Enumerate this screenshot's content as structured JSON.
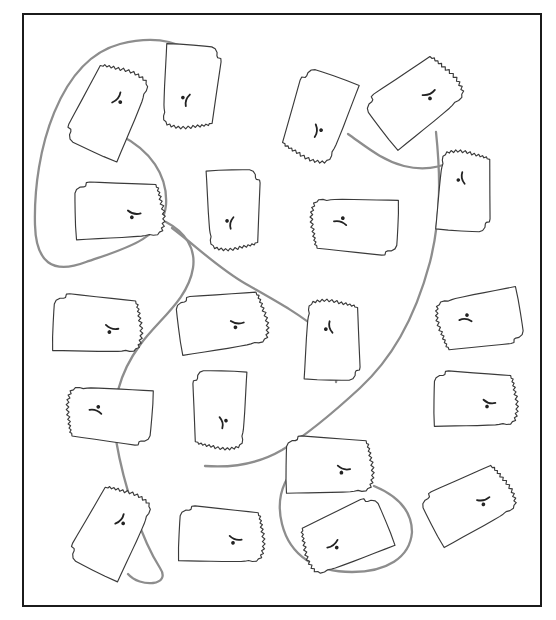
{
  "figure": {
    "shape_name": "pennsylvania",
    "shape_count": 19,
    "connector_count": 6,
    "colors": {
      "background": "#ffffff",
      "frame_border": "#1b1b1b",
      "shape_stroke": "#3a3a3a",
      "shape_fill": "#ffffff",
      "connector_stroke": "#8d8d8d"
    },
    "frame": {
      "x": 22,
      "y": 13,
      "width": 520,
      "height": 594,
      "border_width": 2
    }
  },
  "outline_geometry": {
    "comment": "Normalized Pennsylvania outline in a 100 x 61 local box. Western and northern edges straight; eastern edge is the jagged Delaware River; southwest notch and Erie triangle included.",
    "viewbox": "0 0 100 61",
    "path": "M 2.0 12.4 L 3.6 8.6 L 7.4 6.2 L 11.0 6.0 L 13.0 5.0 L 13.6 1.6 L 17.0 1.0 L 27.0 1.4 L 44.0 2.1 L 60.0 2.7 L 74.0 3.2 L 84.6 3.6 L 85.2 6.4 L 87.4 7.2 L 86.2 10.0 L 88.6 11.6 L 87.2 14.2 L 90.0 15.8 L 88.0 18.6 L 91.0 20.6 L 89.0 23.4 L 92.6 25.2 L 90.4 28.4 L 93.6 30.6 L 91.2 33.6 L 94.2 35.8 L 91.6 38.6 L 94.0 41.0 L 91.0 43.2 L 93.2 46.0 L 90.2 47.8 L 91.6 50.6 L 88.2 52.0 L 86.4 54.6 L 82.0 55.2 L 78.0 54.4 L 74.0 55.4 L 70.0 56.0 L 62.0 56.6 L 50.0 57.4 L 38.0 58.0 L 26.0 58.6 L 14.0 59.2 L 3.6 59.8 L 2.6 46.0 L 2.2 32.0 L 2.0 20.0 Z",
    "inner_marks": [
      {
        "name": "susquehanna-river-mark",
        "path": "M 56 30 q 6 5 13 3"
      },
      {
        "name": "city-dot-mark",
        "path": "M 60 36 a 1 1 0 1 0 0.1 0"
      }
    ]
  },
  "shapes": [
    {
      "id": "shape-01",
      "label": "pennsylvania-outline-1",
      "cx": 110,
      "cy": 108,
      "w": 98,
      "h": 62,
      "rotate": -64,
      "flip": false
    },
    {
      "id": "shape-02",
      "label": "pennsylvania-outline-2",
      "cx": 190,
      "cy": 89,
      "w": 92,
      "h": 58,
      "rotate": 96,
      "flip": false
    },
    {
      "id": "shape-03",
      "label": "pennsylvania-outline-3",
      "cx": 318,
      "cy": 119,
      "w": 96,
      "h": 60,
      "rotate": -72,
      "flip": true
    },
    {
      "id": "shape-04",
      "label": "pennsylvania-outline-4",
      "cx": 418,
      "cy": 99,
      "w": 100,
      "h": 62,
      "rotate": -36,
      "flip": false
    },
    {
      "id": "shape-05",
      "label": "pennsylvania-outline-5",
      "cx": 464,
      "cy": 189,
      "w": 88,
      "h": 56,
      "rotate": 92,
      "flip": true
    },
    {
      "id": "shape-06",
      "label": "pennsylvania-outline-6",
      "cx": 122,
      "cy": 211,
      "w": 98,
      "h": 60,
      "rotate": 0,
      "flip": false
    },
    {
      "id": "shape-07",
      "label": "pennsylvania-outline-7",
      "cx": 233,
      "cy": 212,
      "w": 88,
      "h": 56,
      "rotate": 90,
      "flip": false
    },
    {
      "id": "shape-08",
      "label": "pennsylvania-outline-8",
      "cx": 352,
      "cy": 225,
      "w": 96,
      "h": 58,
      "rotate": 184,
      "flip": false
    },
    {
      "id": "shape-09",
      "label": "pennsylvania-outline-9",
      "cx": 100,
      "cy": 325,
      "w": 98,
      "h": 60,
      "rotate": 4,
      "flip": false
    },
    {
      "id": "shape-10",
      "label": "pennsylvania-outline-10",
      "cx": 225,
      "cy": 322,
      "w": 98,
      "h": 60,
      "rotate": -6,
      "flip": false
    },
    {
      "id": "shape-11",
      "label": "pennsylvania-outline-11",
      "cx": 332,
      "cy": 338,
      "w": 88,
      "h": 58,
      "rotate": 90,
      "flip": true
    },
    {
      "id": "shape-12",
      "label": "pennsylvania-outline-12",
      "cx": 477,
      "cy": 320,
      "w": 92,
      "h": 58,
      "rotate": 172,
      "flip": false
    },
    {
      "id": "shape-13",
      "label": "pennsylvania-outline-13",
      "cx": 107,
      "cy": 414,
      "w": 94,
      "h": 58,
      "rotate": 186,
      "flip": false
    },
    {
      "id": "shape-14",
      "label": "pennsylvania-outline-14",
      "cx": 220,
      "cy": 412,
      "w": 86,
      "h": 56,
      "rotate": -90,
      "flip": true
    },
    {
      "id": "shape-15",
      "label": "pennsylvania-outline-15",
      "cx": 478,
      "cy": 400,
      "w": 92,
      "h": 58,
      "rotate": 2,
      "flip": false
    },
    {
      "id": "shape-16",
      "label": "pennsylvania-outline-16",
      "cx": 332,
      "cy": 466,
      "w": 96,
      "h": 60,
      "rotate": 2,
      "flip": false
    },
    {
      "id": "shape-17",
      "label": "pennsylvania-outline-17",
      "cx": 113,
      "cy": 529,
      "w": 96,
      "h": 60,
      "rotate": -62,
      "flip": false
    },
    {
      "id": "shape-18",
      "label": "pennsylvania-outline-18",
      "cx": 224,
      "cy": 536,
      "w": 94,
      "h": 58,
      "rotate": 4,
      "flip": false
    },
    {
      "id": "shape-19",
      "label": "pennsylvania-outline-19",
      "cx": 343,
      "cy": 538,
      "w": 96,
      "h": 58,
      "rotate": -24,
      "flip": true
    },
    {
      "id": "shape-20",
      "label": "pennsylvania-outline-20",
      "cx": 472,
      "cy": 503,
      "w": 96,
      "h": 58,
      "rotate": -26,
      "flip": false
    }
  ],
  "connectors": [
    {
      "id": "link-01",
      "label": "connector-top-left-loop",
      "path": "M 120 135 C 150 150 168 175 166 205 C 163 240 120 250 86 262 C 52 275 36 262 35 225 C 33 150 60 60 120 44 C 160 34 185 44 197 58"
    },
    {
      "id": "link-02",
      "label": "connector-center-left-loop",
      "path": "M 166 222 C 185 232 196 248 193 268 C 188 300 158 320 140 345 C 120 372 110 405 116 440 C 124 487 142 540 160 568 C 172 586 140 588 128 574"
    },
    {
      "id": "link-03",
      "label": "connector-kansas-to-center",
      "path": "M 172 228 C 196 246 218 268 246 284 C 274 300 300 314 318 330 C 334 344 340 360 336 382"
    },
    {
      "id": "link-04",
      "label": "connector-upper-right-pair",
      "path": "M 205 466 C 232 468 258 464 282 450 C 308 434 334 412 360 388 C 390 360 414 322 430 262 C 442 214 440 170 436 132"
    },
    {
      "id": "link-05",
      "label": "connector-right-diagonal",
      "path": "M 348 134 C 368 148 382 160 404 166 C 428 172 450 166 466 152"
    },
    {
      "id": "link-06",
      "label": "connector-bottom-right-loop",
      "path": "M 374 486 C 398 496 412 510 412 532 C 410 558 386 572 352 572 C 316 572 290 556 282 524 C 274 492 288 470 312 452"
    }
  ]
}
